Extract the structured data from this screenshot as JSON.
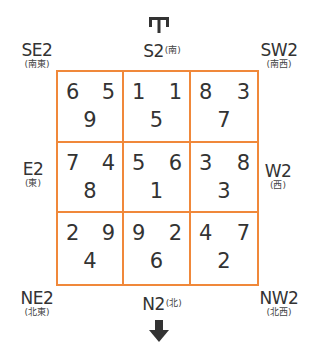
{
  "diagram": {
    "accent_color": "#f0883a",
    "text_color": "#333333",
    "top_icon": "reversed-arrow-up-icon",
    "bottom_icon": "arrow-down-icon"
  },
  "labels": {
    "se": {
      "main": "SE2",
      "sub": "(南東)"
    },
    "s": {
      "main": "S2",
      "sub": "(南)"
    },
    "sw": {
      "main": "SW2",
      "sub": "(南西)"
    },
    "e": {
      "main": "E2",
      "sub": "(東)"
    },
    "w": {
      "main": "W2",
      "sub": "(西)"
    },
    "ne": {
      "main": "NE2",
      "sub": "(北東)"
    },
    "n": {
      "main": "N2",
      "sub": "(北)"
    },
    "nw": {
      "main": "NW2",
      "sub": "(北西)"
    }
  },
  "grid": {
    "rows": [
      [
        {
          "tl": "6",
          "tr": "5",
          "bc": "9"
        },
        {
          "tl": "1",
          "tr": "1",
          "bc": "5"
        },
        {
          "tl": "8",
          "tr": "3",
          "bc": "7"
        }
      ],
      [
        {
          "tl": "7",
          "tr": "4",
          "bc": "8"
        },
        {
          "tl": "5",
          "tr": "6",
          "bc": "1"
        },
        {
          "tl": "3",
          "tr": "8",
          "bc": "3"
        }
      ],
      [
        {
          "tl": "2",
          "tr": "9",
          "bc": "4"
        },
        {
          "tl": "9",
          "tr": "2",
          "bc": "6"
        },
        {
          "tl": "4",
          "tr": "7",
          "bc": "2"
        }
      ]
    ]
  }
}
